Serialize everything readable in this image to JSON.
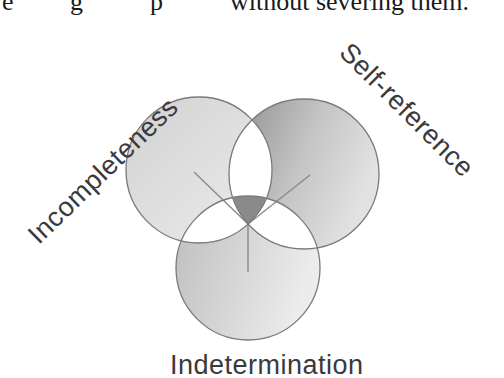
{
  "document": {
    "top_text_fragment_left": "e",
    "top_text_fragment_mid1": "g",
    "top_text_fragment_mid2": "p",
    "top_text_visible": "without severing them."
  },
  "diagram": {
    "type": "three-circle venn diagram",
    "labels": {
      "left": "Incompleteness",
      "right": "Self-reference",
      "bottom": "Indetermination"
    },
    "circles": [
      {
        "name": "left",
        "cx": 199,
        "cy": 170,
        "r": 73,
        "fill_light": "#e6e6e6",
        "fill_dark": "#c9c9c9"
      },
      {
        "name": "right",
        "cx": 304,
        "cy": 174,
        "r": 75,
        "fill_light": "#dedede",
        "fill_dark": "#8f8f8f"
      },
      {
        "name": "bottom",
        "cx": 248,
        "cy": 268,
        "r": 72,
        "fill_light": "#e4e4e4",
        "fill_dark": "#bdbdbd"
      }
    ],
    "colors": {
      "outline": "#7a7a7a",
      "pair_overlap": "#ffffff",
      "center_overlap": "#8a8a8a",
      "label_text": "#3a3a3a"
    }
  }
}
